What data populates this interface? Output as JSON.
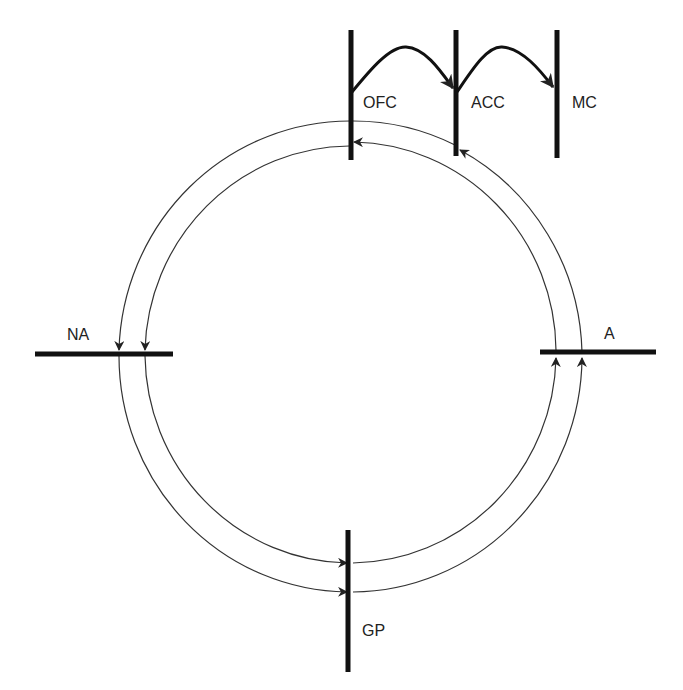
{
  "diagram": {
    "type": "circuit-loop",
    "nodes": [
      {
        "id": "OFC",
        "label": "OFC"
      },
      {
        "id": "ACC",
        "label": "ACC"
      },
      {
        "id": "MC",
        "label": "MC"
      },
      {
        "id": "NA",
        "label": "NA"
      },
      {
        "id": "A",
        "label": "A"
      },
      {
        "id": "GP",
        "label": "GP"
      }
    ],
    "edges": [
      {
        "from": "OFC",
        "to": "ACC",
        "style": "thick-arc"
      },
      {
        "from": "ACC",
        "to": "MC",
        "style": "thick-arc"
      },
      {
        "from": "OFC",
        "to": "NA",
        "style": "outer-ring"
      },
      {
        "from": "ACC",
        "to": "A",
        "style": "ring"
      },
      {
        "from": "NA",
        "to": "GP",
        "style": "ring"
      },
      {
        "from": "A",
        "to": "GP",
        "style": "ring"
      },
      {
        "from": "GP",
        "to": "A",
        "style": "ring"
      },
      {
        "from": "A",
        "to": "OFC",
        "style": "inner-ring"
      },
      {
        "from": "A",
        "to": "ACC",
        "style": "outer-ring"
      }
    ],
    "colors": {
      "line": "#222222",
      "background": "#ffffff"
    }
  }
}
